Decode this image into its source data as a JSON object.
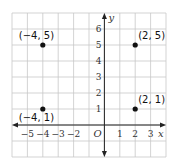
{
  "chart_data": {
    "type": "scatter",
    "title": "",
    "xlabel": "x",
    "ylabel": "y",
    "origin_label": "O",
    "xlim": [
      -6,
      4
    ],
    "ylim": [
      -2,
      7
    ],
    "grid": true,
    "x_ticks": [
      "−5",
      "−4",
      "−3",
      "−2",
      "1",
      "2",
      "3"
    ],
    "y_ticks": [
      "1",
      "2",
      "3",
      "4",
      "5",
      "6"
    ],
    "points": [
      {
        "x": -4,
        "y": 5,
        "label": "(−4, 5)"
      },
      {
        "x": 2,
        "y": 5,
        "label": "(2, 5)"
      },
      {
        "x": -4,
        "y": 1,
        "label": "(−4, 1)"
      },
      {
        "x": 2,
        "y": 1,
        "label": "(2, 1)"
      }
    ]
  },
  "colors": {
    "grid": "#c8c8c8",
    "axis": "#222222",
    "point": "#111111"
  }
}
